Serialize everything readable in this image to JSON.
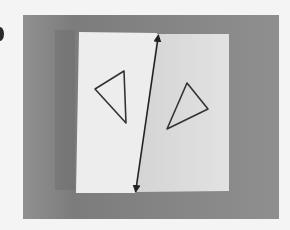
{
  "image": {
    "description": "Photograph of a sheet of paper folded along a line, showing two triangles that are reflections of each other across the fold line marked with a double-headed arrow",
    "colors": {
      "page_background": "#f4f4f4",
      "backdrop": "#8c8c8c",
      "paper_left": "#ececec",
      "paper_right": "#dedede",
      "ink": "#2b2b2b"
    },
    "shapes": [
      {
        "name": "left-triangle",
        "points": [
          [
            95,
            89
          ],
          [
            124,
            71
          ],
          [
            126,
            123
          ]
        ]
      },
      {
        "name": "right-triangle",
        "points": [
          [
            167,
            129
          ],
          [
            187,
            83
          ],
          [
            208,
            109
          ]
        ]
      },
      {
        "name": "fold-line-arrow",
        "from": [
          158,
          35
        ],
        "to": [
          136,
          192
        ]
      }
    ]
  }
}
